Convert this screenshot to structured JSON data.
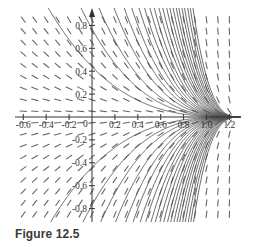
{
  "figure": {
    "caption": "Figure 12.5"
  },
  "chart_data": {
    "type": "line",
    "title": "",
    "subtitle": "Slope field with solution curves converging toward the x-axis near x ≈ 1.3",
    "xlabel": "",
    "ylabel": "",
    "xlim": [
      -0.65,
      1.3
    ],
    "ylim": [
      -0.9,
      0.9
    ],
    "grid": false,
    "legend": null,
    "x_ticks": [
      -0.6,
      -0.4,
      -0.2,
      0.2,
      0.4,
      0.6,
      0.8,
      1.0,
      1.2
    ],
    "x_tick_labels": [
      "-0.6",
      "-0.4",
      "-0.2",
      "0.2",
      "0.4",
      "0.6",
      "0.8",
      "1.0",
      "1.2"
    ],
    "y_ticks": [
      0.8,
      0.6,
      0.4,
      0.2,
      -0.2,
      -0.4,
      -0.6,
      -0.8
    ],
    "y_tick_labels": [
      "0.8",
      "0.6",
      "0.4",
      "0.2",
      "-0.2",
      "-0.4",
      "-0.6",
      "-0.8"
    ],
    "origin_label": "0",
    "field": {
      "description": "direction field segments on a regular grid",
      "x_spacing": 0.1,
      "y_spacing": 0.1,
      "x0": 1.3,
      "exponent": 3
    },
    "solution_curves": {
      "description": "y = C (x0 - x)^k for several C, both signs, converging at (x0, 0)",
      "C_values": [
        0.2,
        0.35,
        0.5,
        0.7,
        0.9,
        1.1,
        1.35,
        1.6,
        1.9,
        2.2,
        2.6,
        3.0,
        3.5,
        4.0,
        4.6,
        5.3,
        6.0,
        7.0,
        8.0,
        9.5,
        11,
        13
      ],
      "exponent": 3,
      "x0": 1.3
    },
    "colors": {
      "axis": "#333333",
      "curve": "#555555",
      "field": "#666666"
    }
  }
}
